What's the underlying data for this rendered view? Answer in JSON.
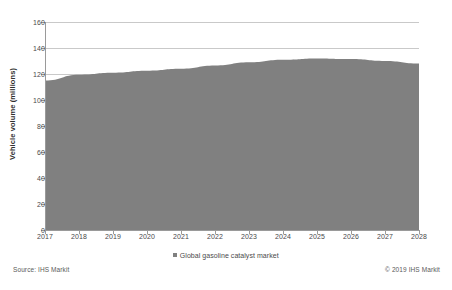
{
  "chart_data": {
    "type": "area",
    "title": "",
    "xlabel": "",
    "ylabel": "Vehicle volume (millions)",
    "categories": [
      "2017",
      "2018",
      "2019",
      "2020",
      "2021",
      "2022",
      "2023",
      "2024",
      "2025",
      "2026",
      "2027",
      "2028"
    ],
    "series": [
      {
        "name": "Global gasoline catalyst market",
        "color": "#808080",
        "values": [
          115,
          119.5,
          121,
          122.5,
          124,
          126.5,
          129,
          131,
          132,
          131.5,
          130,
          128
        ]
      }
    ],
    "ylim": [
      0,
      160
    ],
    "yticks": [
      0,
      20,
      40,
      60,
      80,
      100,
      120,
      140,
      160
    ],
    "grid": "horizontal",
    "legend_position": "bottom"
  },
  "axes": {
    "y_title": "Vehicle volume (millions)",
    "y_tick_labels": [
      "160",
      "140",
      "120",
      "100",
      "80",
      "60",
      "40",
      "20",
      "0"
    ],
    "x_tick_labels": [
      "2017",
      "2018",
      "2019",
      "2020",
      "2021",
      "2022",
      "2023",
      "2024",
      "2025",
      "2026",
      "2027",
      "2028"
    ]
  },
  "legend": {
    "items": [
      {
        "label": "Global gasoline catalyst market",
        "color": "#808080"
      }
    ]
  },
  "footer": {
    "source": "Source: IHS Markit",
    "copyright": "© 2019 IHS Markit"
  },
  "colors": {
    "series_fill": "#808080",
    "gridline": "#c9c9c9",
    "axis": "#9a9a9a",
    "background": "#ffffff",
    "text": "#4a4a4a"
  }
}
